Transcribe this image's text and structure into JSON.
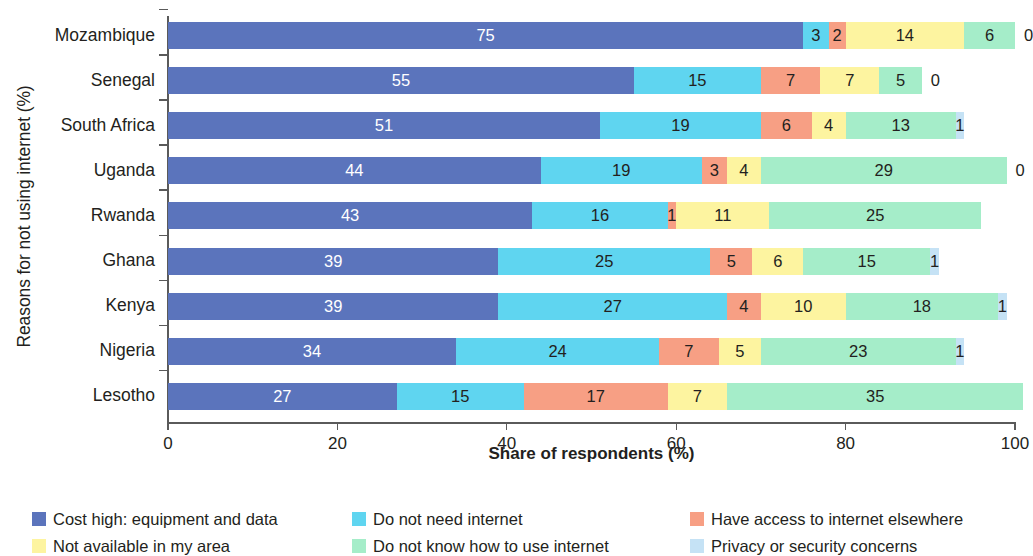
{
  "chart_data": {
    "type": "bar",
    "orientation": "horizontal",
    "stacked": true,
    "title": "",
    "xlabel": "Share of respondents (%)",
    "ylabel": "Reasons for not using internet (%)",
    "xlim": [
      0,
      100
    ],
    "xticks": [
      0,
      20,
      40,
      60,
      80,
      100
    ],
    "xtick_labels": [
      "0",
      "20",
      "40",
      "60",
      "80",
      "100"
    ],
    "grid": false,
    "legend_position": "bottom",
    "categories": [
      "Mozambique",
      "Senegal",
      "South Africa",
      "Uganda",
      "Rwanda",
      "Ghana",
      "Kenya",
      "Nigeria",
      "Lesotho"
    ],
    "series": [
      {
        "name": "Cost high: equipment and data",
        "color": "#5b74bc",
        "text_color": "#ffffff",
        "values": [
          75,
          55,
          51,
          44,
          43,
          39,
          39,
          34,
          27
        ],
        "labels": [
          "75",
          "55",
          "51",
          "44",
          "43",
          "39",
          "39",
          "34",
          "27"
        ]
      },
      {
        "name": "Do not need internet",
        "color": "#5fd5f0",
        "text_color": "#231f20",
        "values": [
          3,
          15,
          19,
          19,
          16,
          25,
          27,
          24,
          15
        ],
        "labels": [
          "3",
          "15",
          "19",
          "19",
          "16",
          "25",
          "27",
          "24",
          "15"
        ]
      },
      {
        "name": "Have access to internet elsewhere",
        "color": "#f79f84",
        "text_color": "#231f20",
        "values": [
          2,
          7,
          6,
          3,
          1,
          5,
          4,
          7,
          17
        ],
        "labels": [
          "2",
          "7",
          "6",
          "3",
          "1",
          "5",
          "4",
          "7",
          "17"
        ]
      },
      {
        "name": "Not available in my area",
        "color": "#fdf4a0",
        "text_color": "#231f20",
        "values": [
          14,
          7,
          4,
          4,
          11,
          6,
          10,
          5,
          7
        ],
        "labels": [
          "14",
          "7",
          "4",
          "4",
          "11",
          "6",
          "10",
          "5",
          "7"
        ]
      },
      {
        "name": "Do not know how to use internet",
        "color": "#a5edc9",
        "text_color": "#231f20",
        "values": [
          6,
          5,
          13,
          29,
          25,
          15,
          18,
          23,
          35
        ],
        "labels": [
          "6",
          "5",
          "13",
          "29",
          "25",
          "15",
          "18",
          "23",
          "35"
        ]
      },
      {
        "name": "Privacy or security concerns",
        "color": "#c5e2f5",
        "text_color": "#231f20",
        "values": [
          0,
          0,
          1,
          0,
          null,
          1,
          1,
          1,
          null
        ],
        "labels": [
          "0",
          "0",
          "1",
          "0",
          "",
          "1",
          "1",
          "1",
          ""
        ]
      }
    ],
    "legend": [
      {
        "label": "Cost high: equipment and data",
        "color": "#5b74bc"
      },
      {
        "label": "Do not need internet",
        "color": "#5fd5f0"
      },
      {
        "label": "Have access to internet elsewhere",
        "color": "#f79f84"
      },
      {
        "label": "Not available in my area",
        "color": "#fdf4a0"
      },
      {
        "label": "Do not know how to use internet",
        "color": "#a5edc9"
      },
      {
        "label": "Privacy or security concerns",
        "color": "#c5e2f5"
      }
    ]
  }
}
